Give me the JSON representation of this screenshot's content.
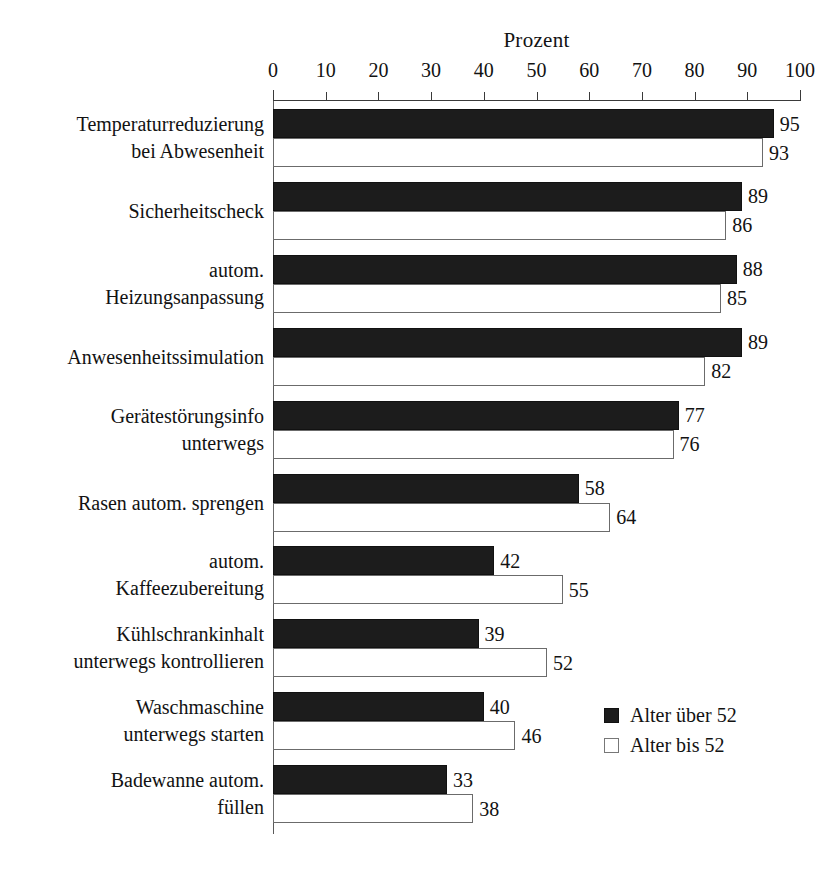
{
  "chart_data": {
    "type": "bar",
    "orientation": "horizontal",
    "title": "",
    "xlabel": "Prozent",
    "ylabel": "",
    "xlim": [
      0,
      100
    ],
    "xticks": [
      0,
      10,
      20,
      30,
      40,
      50,
      60,
      70,
      80,
      90,
      100
    ],
    "grid": false,
    "legend_position": "bottom-right",
    "categories": [
      "Temperaturreduzierung bei Abwesenheit",
      "Sicherheitscheck",
      "autom. Heizungsanpassung",
      "Anwesenheitssimulation",
      "Gerätestörungsinfo unterwegs",
      "Rasen autom. sprengen",
      "autom. Kaffeezubereitung",
      "Kühlschrankinhalt unterwegs kontrollieren",
      "Waschmaschine unterwegs starten",
      "Badewanne autom. füllen"
    ],
    "category_lines": [
      [
        "Temperaturreduzierung",
        "bei Abwesenheit"
      ],
      [
        "Sicherheitscheck"
      ],
      [
        "autom.",
        "Heizungsanpassung"
      ],
      [
        "Anwesenheitssimulation"
      ],
      [
        "Gerätestörungsinfo",
        "unterwegs"
      ],
      [
        "Rasen autom. sprengen"
      ],
      [
        "autom.",
        "Kaffeezubereitung"
      ],
      [
        "Kühlschrankinhalt",
        "unterwegs kontrollieren"
      ],
      [
        "Waschmaschine",
        "unterwegs starten"
      ],
      [
        "Badewanne autom.",
        "füllen"
      ]
    ],
    "series": [
      {
        "name": "Alter über 52",
        "color": "#1c1c1c",
        "values": [
          95,
          89,
          88,
          89,
          77,
          58,
          42,
          39,
          40,
          33
        ]
      },
      {
        "name": "Alter bis 52",
        "color": "#ffffff",
        "values": [
          93,
          86,
          85,
          82,
          76,
          64,
          55,
          52,
          46,
          38
        ]
      }
    ]
  },
  "legend": {
    "items": [
      {
        "label": "Alter über 52",
        "swatch": "dark"
      },
      {
        "label": "Alter bis 52",
        "swatch": "light"
      }
    ]
  },
  "axis": {
    "title": "Prozent",
    "ticks": [
      "0",
      "10",
      "20",
      "30",
      "40",
      "50",
      "60",
      "70",
      "80",
      "90",
      "100"
    ]
  }
}
